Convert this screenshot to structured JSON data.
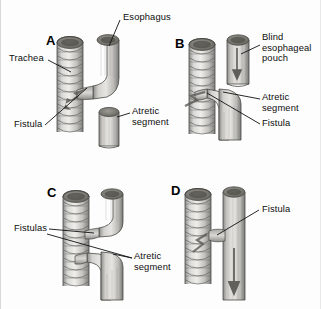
{
  "figure": {
    "background_color": "#fdfdfd",
    "ink_color": "#0d0d0d",
    "width": 321,
    "height": 309
  },
  "panels": [
    {
      "id": "A",
      "letter": "A",
      "description": "Esophageal atresia with distal tracheoesophageal fistula",
      "structures": [
        "trachea",
        "esophagus",
        "fistula",
        "atretic segment"
      ]
    },
    {
      "id": "B",
      "letter": "B",
      "description": "Blind esophageal pouch with distal fistula",
      "structures": [
        "trachea",
        "blind esophageal pouch",
        "atretic segment",
        "fistula"
      ]
    },
    {
      "id": "C",
      "letter": "C",
      "description": "Atresia with proximal and distal fistulas",
      "structures": [
        "trachea",
        "esophagus",
        "fistulas",
        "atretic segment"
      ]
    },
    {
      "id": "D",
      "letter": "D",
      "description": "H-type tracheoesophageal fistula without atresia",
      "structures": [
        "trachea",
        "esophagus",
        "fistula"
      ]
    }
  ],
  "labels": {
    "esophagus": "Esophagus",
    "trachea": "Trachea",
    "fistula_a": "Fistula",
    "atretic_segment_a": "Atretic\nsegment",
    "blind_esophageal_pouch": "Blind\nesophageal\npouch",
    "atretic_segment_b": "Atretic\nsegment",
    "fistula_b": "Fistula",
    "fistulas_c": "Fistulas",
    "atretic_segment_c": "Atretic\nsegment",
    "fistula_d": "Fistula"
  }
}
